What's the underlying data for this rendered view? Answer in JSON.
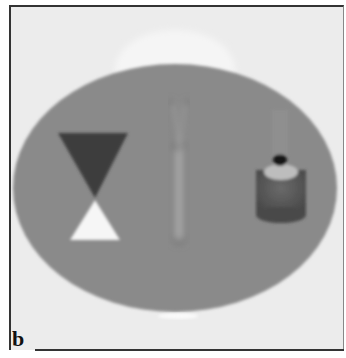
{
  "figure": {
    "panel_label": "b",
    "colors": {
      "background": "#ececec",
      "ellipse": "#8a8a8a",
      "dark_triangle": "#404040",
      "light_triangle": "#f4f4f4",
      "cylinder": "#555555",
      "cylinder_top": "#b8b8b8",
      "dot": "#111111",
      "tube": "#9a9a9a"
    },
    "objects": [
      {
        "name": "ellipse-body",
        "cx": 175,
        "cy": 188,
        "rx": 162,
        "ry": 124
      },
      {
        "name": "hourglass-dark-triangle"
      },
      {
        "name": "hourglass-light-triangle"
      },
      {
        "name": "y-tube"
      },
      {
        "name": "cylinder-with-dot"
      }
    ]
  }
}
